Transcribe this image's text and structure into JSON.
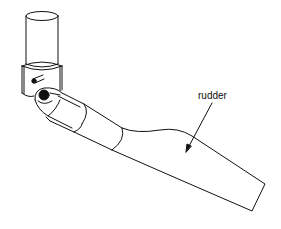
{
  "figure": {
    "labels": [
      {
        "id": "rudder",
        "text": "rudder",
        "x": 198,
        "y": 91
      }
    ],
    "parts": [
      "upper-shaft-cylinder",
      "pivot-bracket",
      "pivot-pin",
      "ball-joint",
      "tube-sleeve",
      "rudder-blade"
    ],
    "colors": {
      "stroke": "#111111",
      "background": "#ffffff"
    }
  }
}
